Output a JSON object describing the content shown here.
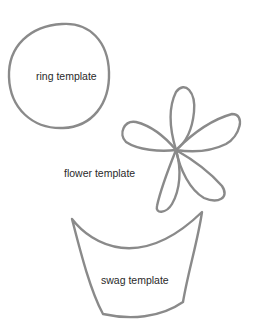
{
  "templates": [
    {
      "name": "ring",
      "label": "ring template"
    },
    {
      "name": "flower",
      "label": "flower template"
    },
    {
      "name": "swag",
      "label": "swag template"
    }
  ],
  "colors": {
    "stroke": "#8a8a8a",
    "text": "#2a2a2a",
    "background": "#ffffff"
  }
}
